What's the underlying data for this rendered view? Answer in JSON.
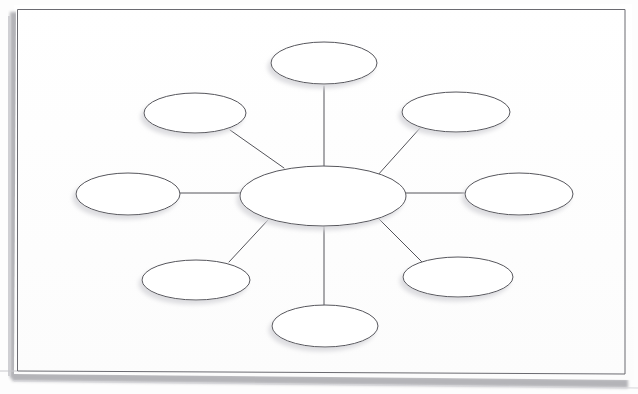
{
  "document": {
    "title": "Concept Map Worksheet",
    "type": "blank spider / web concept map",
    "media": "scanned paper sheet",
    "background_color": "#fdfdfd",
    "paper_color": "#ffffff",
    "ink_color": "#54545a",
    "shadow_color": "#b9b9bd",
    "page_border": {
      "color": "#6a6a70",
      "stroke_width": 1,
      "x": 17,
      "y": 9,
      "width": 608,
      "height": 366,
      "tilt_note": "bottom edge tilts slightly down to the right (scan skew)"
    }
  },
  "diagram": {
    "name": "spider-concept-map",
    "node_count": 9,
    "edge_count": 8,
    "node_fill": "#ffffff",
    "node_stroke": "#54545a",
    "node_stroke_width": 1,
    "edge_stroke": "#54545a",
    "edge_stroke_width": 1,
    "all_nodes_blank": true,
    "center_node": {
      "id": "center",
      "label": "",
      "cx": 323,
      "cy": 196,
      "rx": 83,
      "ry": 30
    },
    "satellite_nodes": [
      {
        "id": "node-top",
        "label": "",
        "cx": 324,
        "cy": 63,
        "rx": 53,
        "ry": 21
      },
      {
        "id": "node-top-right",
        "label": "",
        "cx": 456,
        "cy": 112,
        "rx": 54,
        "ry": 20
      },
      {
        "id": "node-right",
        "label": "",
        "cx": 519,
        "cy": 194,
        "rx": 54,
        "ry": 21
      },
      {
        "id": "node-bottom-right",
        "label": "",
        "cx": 458,
        "cy": 277,
        "rx": 55,
        "ry": 20
      },
      {
        "id": "node-bottom",
        "label": "",
        "cx": 325,
        "cy": 326,
        "rx": 53,
        "ry": 21
      },
      {
        "id": "node-bottom-left",
        "label": "",
        "cx": 196,
        "cy": 280,
        "rx": 54,
        "ry": 20
      },
      {
        "id": "node-left",
        "label": "",
        "cx": 128,
        "cy": 194,
        "rx": 52,
        "ry": 21
      },
      {
        "id": "node-top-left",
        "label": "",
        "cx": 195,
        "cy": 113,
        "rx": 51,
        "ry": 20
      }
    ],
    "edges": [
      {
        "id": "edge-center-top",
        "from": "center",
        "to": "node-top",
        "x1": 324,
        "y1": 167,
        "x2": 324,
        "y2": 85
      },
      {
        "id": "edge-center-top-right",
        "from": "center",
        "to": "node-top-right",
        "x1": 377,
        "y1": 175,
        "x2": 420,
        "y2": 128
      },
      {
        "id": "edge-center-right",
        "from": "center",
        "to": "node-right",
        "x1": 406,
        "y1": 193,
        "x2": 466,
        "y2": 193
      },
      {
        "id": "edge-center-bottom-right",
        "from": "center",
        "to": "node-bottom-right",
        "x1": 378,
        "y1": 219,
        "x2": 421,
        "y2": 262
      },
      {
        "id": "edge-center-bottom",
        "from": "center",
        "to": "node-bottom",
        "x1": 324,
        "y1": 226,
        "x2": 324,
        "y2": 306
      },
      {
        "id": "edge-center-bottom-left",
        "from": "center",
        "to": "node-bottom-left",
        "x1": 268,
        "y1": 220,
        "x2": 230,
        "y2": 262
      },
      {
        "id": "edge-center-left",
        "from": "center",
        "to": "node-left",
        "x1": 240,
        "y1": 193,
        "x2": 180,
        "y2": 193
      },
      {
        "id": "edge-center-top-left",
        "from": "center",
        "to": "node-top-left",
        "x1": 283,
        "y1": 167,
        "x2": 231,
        "y2": 130
      }
    ]
  }
}
